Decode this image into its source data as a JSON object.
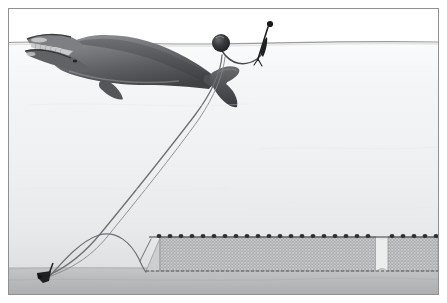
{
  "image": {
    "title": "Right whale entangled in bottom-set gillnet gear",
    "width": 447,
    "height": 303,
    "kind": "scientific illustration",
    "border_color": "#8f9094",
    "background_color": "#ffffff"
  },
  "palette": {
    "sky": "#ffffff",
    "water_top": "#f6f7f8",
    "water_mid": "#f0f1f2",
    "water_deep": "#e4e5e6",
    "seafloor_top": "#c9cacb",
    "seafloor_bottom": "#b4b5b6",
    "waterline": "#9a9b9e",
    "rope": "#6f7073",
    "net_mesh": "#9b9c9e",
    "net_fill": "#cfd0d1",
    "float_dark": "#2e2f31",
    "buoy_dark": "#262729",
    "whale_body": "#6b6c6f",
    "whale_dark": "#3a3b3d",
    "whale_light": "#b7b8ba",
    "anchor": "#1f2022"
  },
  "scene": {
    "waterline": {
      "label": "sea surface",
      "y": 34
    },
    "seafloor": {
      "label": "sea bottom",
      "y": 262
    },
    "elements": [
      {
        "name": "whale",
        "label": "North Atlantic right whale",
        "note": "swimming left with mouth open, entangled by line across tail stock"
      },
      {
        "name": "spherical-buoy",
        "label": "round surface buoy",
        "note": "floating at the sea surface on the buoy line"
      },
      {
        "name": "high-flyer-buoy",
        "label": "high-flyer marker buoy",
        "note": "vertical spar with ball marker above the surface"
      },
      {
        "name": "buoy-line",
        "label": "vertical buoy line",
        "note": "runs from surface buoys down to the anchor on the bottom"
      },
      {
        "name": "anchor",
        "label": "anchor",
        "note": "set on the sea bottom at lower left"
      },
      {
        "name": "groundline",
        "label": "groundline",
        "note": "arcs along the bottom from the anchor to the net end"
      },
      {
        "name": "gillnet",
        "label": "bottom-set gillnet panel",
        "note": "mesh wall with floats along the top float line, with a gap between panels"
      },
      {
        "name": "float-line",
        "label": "float line with floats",
        "count": 28
      }
    ]
  },
  "net": {
    "x": 137,
    "y": 228,
    "width": 294,
    "height": 36,
    "gap_x": 379,
    "gap_width": 12,
    "taper_width": 14
  },
  "a11y": {
    "alt": "Illustration of a right whale entangled in the vertical buoy line of a bottom-set gillnet. A round buoy and a high-flyer marker float at the surface; the line runs down to an anchor on the seafloor, and a groundline connects the anchor to a long gillnet panel with floats along its top edge."
  }
}
